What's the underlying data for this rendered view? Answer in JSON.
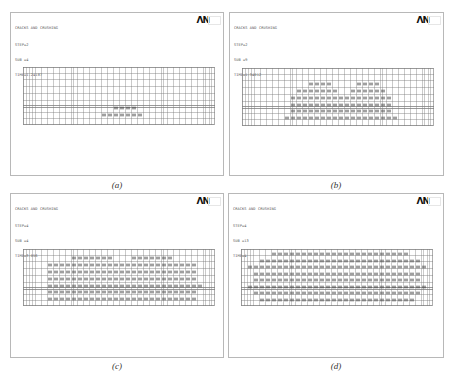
{
  "panels": [
    {
      "id": "a",
      "title": "CRACKS AND CRUSHING",
      "step": "STEP=2",
      "sub": "SUB =4",
      "time": "TIME=1.24187",
      "logo": "ΛN",
      "caption": "(a)",
      "crack_density": "low"
    },
    {
      "id": "b",
      "title": "CRACKS AND CRUSHING",
      "step": "STEP=2",
      "sub": "SUB =9",
      "time": "TIME=1.34012",
      "logo": "ΛN",
      "caption": "(b)",
      "crack_density": "medium"
    },
    {
      "id": "c",
      "title": "CRACKS AND CRUSHING",
      "step": "STEP=4",
      "sub": "SUB =4",
      "time": "TIME=3.056",
      "logo": "ΛN",
      "caption": "(c)",
      "crack_density": "high"
    },
    {
      "id": "d",
      "title": "CRACKS AND CRUSHING",
      "step": "STEP=4",
      "sub": "SUB =13",
      "time": "TIME=4",
      "logo": "ΛN",
      "caption": "(d)",
      "crack_density": "full"
    }
  ],
  "colors": {
    "mesh_line": "#7a7a7a",
    "crack_mark": "#3a3a3a",
    "border": "#b8b8b8"
  }
}
